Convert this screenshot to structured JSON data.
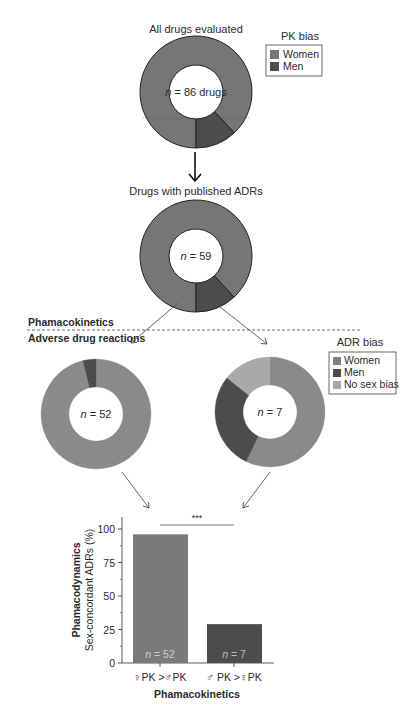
{
  "colors": {
    "women": "#767676",
    "women_light": "#8a8a8a",
    "men": "#4c4c4c",
    "no_bias": "#a9a9a9",
    "stroke": "#222222"
  },
  "top_donut": {
    "title": "All drugs evaluated",
    "center_label_n": "n",
    "center_label_rest": " = 86 drugs"
  },
  "pk_legend": {
    "title": "PK bias",
    "items": [
      "Women",
      "Men"
    ]
  },
  "mid_donut": {
    "title": "Drugs with published ADRs",
    "center_label_n": "n",
    "center_label_rest": " = 59"
  },
  "divider": {
    "upper_label": "Phamacokinetics",
    "lower_label": "Adverse drug reactions"
  },
  "adr_legend": {
    "title": "ADR bias",
    "items": [
      "Women",
      "Men",
      "No sex bias"
    ]
  },
  "left_donut": {
    "center_label_n": "n",
    "center_label_rest": " = 52"
  },
  "right_donut": {
    "center_label_n": "n",
    "center_label_rest": " = 7"
  },
  "bar_chart": {
    "ylabel_bold": "Phamacodynamics",
    "ylabel": "Sex-concordant ADRs (%)",
    "xlabel": "Phamacokinetics",
    "yticks": [
      "0",
      "25",
      "50",
      "75",
      "100"
    ],
    "categories": [
      "♀PK >♂PK",
      "♂ PK >♀PK"
    ],
    "bar_labels_n": [
      "n",
      "n"
    ],
    "bar_labels_rest": [
      " = 52",
      " = 7"
    ],
    "significance": "***"
  },
  "chart_data": [
    {
      "type": "pie",
      "title": "All drugs evaluated",
      "subtitle": "PK bias",
      "total": 86,
      "labels": [
        "Women",
        "Men"
      ],
      "values_percent": [
        88,
        12
      ],
      "center_text": "n = 86 drugs"
    },
    {
      "type": "pie",
      "title": "Drugs with published ADRs",
      "subtitle": "PK bias",
      "total": 59,
      "labels": [
        "Women",
        "Men"
      ],
      "values": [
        52,
        7
      ],
      "center_text": "n = 59"
    },
    {
      "type": "pie",
      "title": "ADR bias (female PK bias drugs)",
      "total": 52,
      "labels": [
        "Women",
        "Men",
        "No sex bias"
      ],
      "values": [
        50,
        2,
        0
      ],
      "center_text": "n = 52"
    },
    {
      "type": "pie",
      "title": "ADR bias (male PK bias drugs)",
      "total": 7,
      "labels": [
        "Women",
        "Men",
        "No sex bias"
      ],
      "values": [
        4,
        2,
        1
      ],
      "center_text": "n = 7"
    },
    {
      "type": "bar",
      "categories": [
        "♀PK > ♂PK",
        "♂PK > ♀PK"
      ],
      "values": [
        96,
        29
      ],
      "bar_annotations": [
        "n = 52",
        "n = 7"
      ],
      "xlabel": "Phamacokinetics",
      "ylabel": "Phamacodynamics Sex-concordant ADRs (%)",
      "ylim": [
        0,
        100
      ],
      "yticks": [
        0,
        25,
        50,
        75,
        100
      ],
      "annotations": [
        "*** (significance between bars)"
      ],
      "grid": false
    }
  ]
}
